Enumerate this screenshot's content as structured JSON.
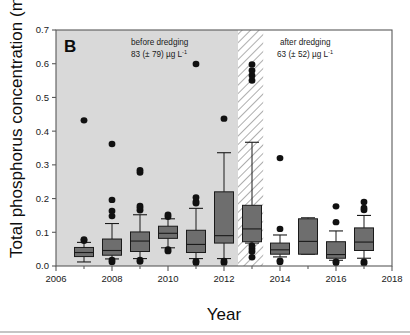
{
  "figure": {
    "panel_letter": "B",
    "background_color": "#ffffff",
    "before_shade_color": "#d9d9d9",
    "box_fill_color": "#6e6e6e",
    "line_color": "#1a1a1a"
  },
  "annotations": {
    "before": {
      "line1": "before dredging",
      "line2_value": "83 (± 79) µg L",
      "line2_sup": "-1"
    },
    "after": {
      "line1": "after dredging",
      "line2_value": "63 (± 52) µg L",
      "line2_sup": "-1"
    }
  },
  "axes": {
    "y_title_main": "Total phosphorus concentration (mg P L",
    "y_title_sup": "-1",
    "y_title_close": ")",
    "x_title": "Year",
    "y_ticks": [
      "0.0",
      "0.1",
      "0.2",
      "0.3",
      "0.4",
      "0.5",
      "0.6",
      "0.7"
    ],
    "x_ticks": [
      "2006",
      "2008",
      "2010",
      "2012",
      "2014",
      "2016",
      "2018"
    ]
  },
  "chart_data": {
    "type": "box",
    "title": "",
    "xlabel": "Year",
    "ylabel": "Total phosphorus concentration (mg P L-1)",
    "xlim": [
      2006,
      2018
    ],
    "ylim": [
      0.0,
      0.7
    ],
    "y_ticks": [
      0.0,
      0.1,
      0.2,
      0.3,
      0.4,
      0.5,
      0.6,
      0.7
    ],
    "x_ticks": [
      2006,
      2008,
      2010,
      2012,
      2014,
      2016,
      2018
    ],
    "x_minor_ticks": [
      2007,
      2009,
      2011,
      2013,
      2015,
      2017
    ],
    "grid": false,
    "legend": "none",
    "shaded_regions": [
      {
        "name": "before dredging",
        "x_start": 2006,
        "x_end": 2012.5,
        "style": "solid-gray"
      },
      {
        "name": "dredging period",
        "x_start": 2012.5,
        "x_end": 2013.4,
        "style": "diagonal-hatch"
      },
      {
        "name": "after dredging",
        "x_start": 2013.4,
        "x_end": 2018,
        "style": "white"
      }
    ],
    "annotations": [
      {
        "text": "before dredging 83 (± 79) µg L-1",
        "x": 2009.2,
        "y": 0.665
      },
      {
        "text": "after dredging 63 (± 52) µg L-1",
        "x": 2015.3,
        "y": 0.665
      },
      {
        "text": "B",
        "x": 2006.3,
        "y": 0.665
      }
    ],
    "boxes": [
      {
        "year": 2007,
        "whisker_low": 0.012,
        "q1": 0.028,
        "median": 0.04,
        "q3": 0.055,
        "whisker_high": 0.07,
        "outliers": [
          0.075,
          0.079,
          0.432
        ]
      },
      {
        "year": 2008,
        "whisker_low": 0.021,
        "q1": 0.032,
        "median": 0.046,
        "q3": 0.08,
        "whisker_high": 0.126,
        "outliers": [
          0.012,
          0.018,
          0.148,
          0.163,
          0.196,
          0.362
        ]
      },
      {
        "year": 2009,
        "whisker_low": 0.022,
        "q1": 0.043,
        "median": 0.074,
        "q3": 0.101,
        "whisker_high": 0.152,
        "outliers": [
          0.013,
          0.018,
          0.165,
          0.172,
          0.178,
          0.277,
          0.284
        ]
      },
      {
        "year": 2010,
        "whisker_low": 0.054,
        "q1": 0.082,
        "median": 0.097,
        "q3": 0.118,
        "whisker_high": 0.14,
        "outliers": [
          0.044,
          0.049,
          0.146,
          0.152
        ]
      },
      {
        "year": 2011,
        "whisker_low": 0.022,
        "q1": 0.04,
        "median": 0.064,
        "q3": 0.106,
        "whisker_high": 0.171,
        "outliers": [
          0.009,
          0.014,
          0.186,
          0.191,
          0.203,
          0.599
        ]
      },
      {
        "year": 2012,
        "whisker_low": 0.022,
        "q1": 0.068,
        "median": 0.09,
        "q3": 0.22,
        "whisker_high": 0.336,
        "outliers": [
          0.01,
          0.015,
          0.437
        ]
      },
      {
        "year": 2013,
        "whisker_low": 0.068,
        "q1": 0.072,
        "median": 0.11,
        "q3": 0.18,
        "whisker_high": 0.367,
        "outliers": [
          0.026,
          0.043,
          0.051,
          0.06,
          0.55,
          0.565,
          0.58,
          0.598
        ]
      },
      {
        "year": 2014,
        "whisker_low": 0.027,
        "q1": 0.035,
        "median": 0.048,
        "q3": 0.068,
        "whisker_high": 0.092,
        "outliers": [
          0.012,
          0.016,
          0.11,
          0.32
        ]
      },
      {
        "year": 2015,
        "whisker_low": 0.035,
        "q1": 0.035,
        "median": 0.073,
        "q3": 0.14,
        "whisker_high": 0.143,
        "outliers": []
      },
      {
        "year": 2016,
        "whisker_low": 0.017,
        "q1": 0.023,
        "median": 0.034,
        "q3": 0.072,
        "whisker_high": 0.104,
        "outliers": [
          0.009,
          0.013,
          0.13,
          0.177
        ]
      },
      {
        "year": 2017,
        "whisker_low": 0.023,
        "q1": 0.046,
        "median": 0.071,
        "q3": 0.113,
        "whisker_high": 0.15,
        "outliers": [
          0.008,
          0.013,
          0.166,
          0.172,
          0.19
        ]
      }
    ]
  }
}
